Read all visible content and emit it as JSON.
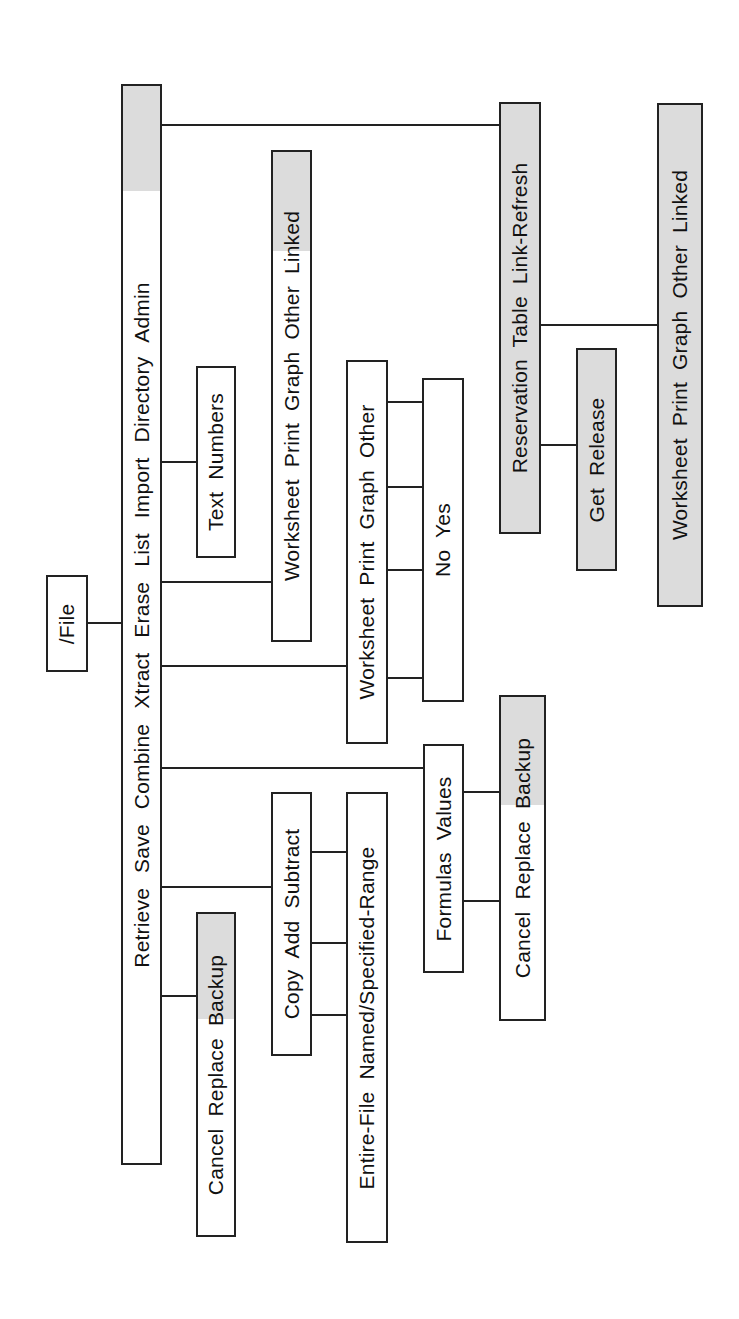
{
  "diagram": {
    "root": {
      "label": "/File"
    },
    "main_menu": {
      "items": [
        "Retrieve",
        "Save",
        "Combine",
        "Xtract",
        "Erase",
        "List",
        "Import",
        "Directory",
        "Admin"
      ],
      "shaded": [
        "Admin"
      ]
    },
    "submenus": {
      "save": {
        "parent": "Save",
        "items": [
          "Cancel",
          "Replace",
          "Backup"
        ],
        "shaded": [
          "Backup"
        ]
      },
      "combine": {
        "parent": "Combine",
        "items": [
          "Copy",
          "Add",
          "Subtract"
        ]
      },
      "combine_range": {
        "parent": "Copy/Add/Subtract",
        "items": [
          "Entire-File",
          "Named/Specified-Range"
        ]
      },
      "xtract": {
        "parent": "Xtract",
        "items": [
          "Formulas",
          "Values"
        ]
      },
      "xtract_confirm": {
        "parent": "Formulas/Values",
        "items": [
          "Cancel",
          "Replace",
          "Backup"
        ],
        "shaded": [
          "Backup"
        ]
      },
      "erase": {
        "parent": "Erase",
        "items": [
          "Worksheet",
          "Print",
          "Graph",
          "Other"
        ]
      },
      "erase_confirm": {
        "parent": "Worksheet/Print/Graph/Other",
        "items": [
          "No",
          "Yes"
        ]
      },
      "list": {
        "parent": "List",
        "items": [
          "Worksheet",
          "Print",
          "Graph",
          "Other",
          "Linked"
        ],
        "shaded": [
          "Linked"
        ]
      },
      "import": {
        "parent": "Import",
        "items": [
          "Text",
          "Numbers"
        ]
      },
      "admin": {
        "parent": "Admin",
        "items": [
          "Reservation",
          "Table",
          "Link-Refresh"
        ],
        "shaded": [
          "Reservation",
          "Table",
          "Link-Refresh"
        ]
      },
      "admin_reservation": {
        "parent": "Reservation",
        "items": [
          "Get",
          "Release"
        ],
        "shaded": [
          "Get",
          "Release"
        ]
      },
      "admin_table": {
        "parent": "Table",
        "items": [
          "Worksheet",
          "Print",
          "Graph",
          "Other",
          "Linked"
        ],
        "shaded": [
          "Worksheet",
          "Print",
          "Graph",
          "Other",
          "Linked"
        ]
      }
    }
  },
  "text": {
    "root": "/File",
    "main": "Retrieve  Save  Combine  Xtract  Erase  List  Import  Directory  Admin",
    "save": "Cancel  Replace  Backup",
    "combine": "Copy  Add  Subtract",
    "combine_range": "Entire-File  Named/Specified-Range",
    "xtract": "Formulas  Values",
    "xtract_confirm": "Cancel  Replace  Backup",
    "erase": "Worksheet  Print  Graph  Other",
    "erase_confirm": "No  Yes",
    "list": "Worksheet  Print  Graph  Other  Linked",
    "import": "Text  Numbers",
    "admin": "Reservation  Table  Link-Refresh",
    "admin_reservation": "Get  Release",
    "admin_table": "Worksheet  Print  Graph  Other  Linked"
  }
}
